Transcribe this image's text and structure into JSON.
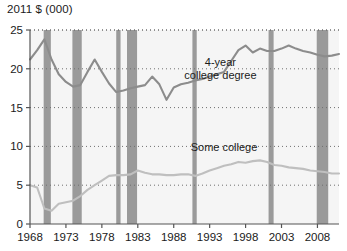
{
  "chart_data": {
    "type": "line",
    "title": "",
    "ylabel": "2011 $ (000)",
    "xlabel": "",
    "ylim": [
      0,
      25
    ],
    "xlim": [
      1968,
      2011
    ],
    "yticks": [
      0,
      5,
      10,
      15,
      20,
      25
    ],
    "ytick_labels": [
      "0",
      "5",
      "10",
      "15",
      "20",
      "25"
    ],
    "xticks": [
      1968,
      1973,
      1978,
      1983,
      1988,
      1993,
      1998,
      2003,
      2008
    ],
    "xtick_labels": [
      "1968",
      "1973",
      "1978",
      "1983",
      "1988",
      "1993",
      "1998",
      "2003",
      "2008"
    ],
    "grid": true,
    "grid_style": "dotted-horizontal",
    "legend_position": "inline-annotation",
    "x": [
      1968,
      1969,
      1970,
      1971,
      1972,
      1973,
      1974,
      1975,
      1976,
      1977,
      1978,
      1979,
      1980,
      1981,
      1982,
      1983,
      1984,
      1985,
      1986,
      1987,
      1988,
      1989,
      1990,
      1991,
      1992,
      1993,
      1994,
      1995,
      1996,
      1997,
      1998,
      1999,
      2000,
      2001,
      2002,
      2003,
      2004,
      2005,
      2006,
      2007,
      2008,
      2009,
      2010,
      2011
    ],
    "series": [
      {
        "name": "4-year college degree",
        "color": "#8c8c8c",
        "values": [
          21.2,
          22.4,
          23.8,
          21.2,
          19.3,
          18.3,
          17.7,
          17.9,
          19.6,
          21.2,
          19.6,
          18.1,
          17.0,
          17.2,
          17.5,
          17.7,
          17.9,
          19.0,
          18.0,
          16.0,
          17.6,
          18.0,
          18.2,
          18.5,
          18.7,
          19.0,
          19.3,
          19.6,
          21.0,
          22.4,
          23.0,
          22.1,
          22.6,
          22.3,
          22.3,
          22.6,
          23.0,
          22.6,
          22.3,
          22.1,
          21.8,
          21.6,
          21.7,
          21.9
        ]
      },
      {
        "name": "Some college",
        "color": "#bfbfbf",
        "values": [
          5.0,
          4.7,
          2.0,
          1.7,
          2.6,
          2.8,
          3.0,
          3.6,
          4.4,
          5.0,
          5.6,
          6.2,
          6.3,
          6.3,
          6.4,
          6.9,
          6.6,
          6.4,
          6.4,
          6.3,
          6.3,
          6.4,
          6.4,
          6.2,
          6.5,
          6.9,
          7.2,
          7.5,
          7.7,
          8.0,
          7.9,
          8.1,
          8.2,
          8.0,
          7.6,
          7.5,
          7.3,
          7.2,
          7.1,
          6.9,
          6.8,
          6.7,
          6.5,
          6.5
        ]
      }
    ],
    "recession_bands": [
      {
        "start": 1969.9,
        "end": 1970.9
      },
      {
        "start": 1973.9,
        "end": 1975.2
      },
      {
        "start": 1980.0,
        "end": 1980.6
      },
      {
        "start": 1981.5,
        "end": 1982.9
      },
      {
        "start": 1990.6,
        "end": 1991.2
      },
      {
        "start": 2001.2,
        "end": 2001.9
      },
      {
        "start": 2007.9,
        "end": 2009.5
      }
    ],
    "recession_band_color": "#9a9a9a",
    "annotations": [
      {
        "id": "label-4year",
        "text_line1": "4-year",
        "text_line2": "college degree",
        "x": 1994.5,
        "y": 20.4
      },
      {
        "id": "label-some-college",
        "text_line1": "Some college",
        "text_line2": "",
        "x": 1995.0,
        "y": 9.4
      }
    ],
    "plot_background": "#f5f5f5",
    "axis_color": "#555555",
    "text_color": "#1a1a1a"
  }
}
